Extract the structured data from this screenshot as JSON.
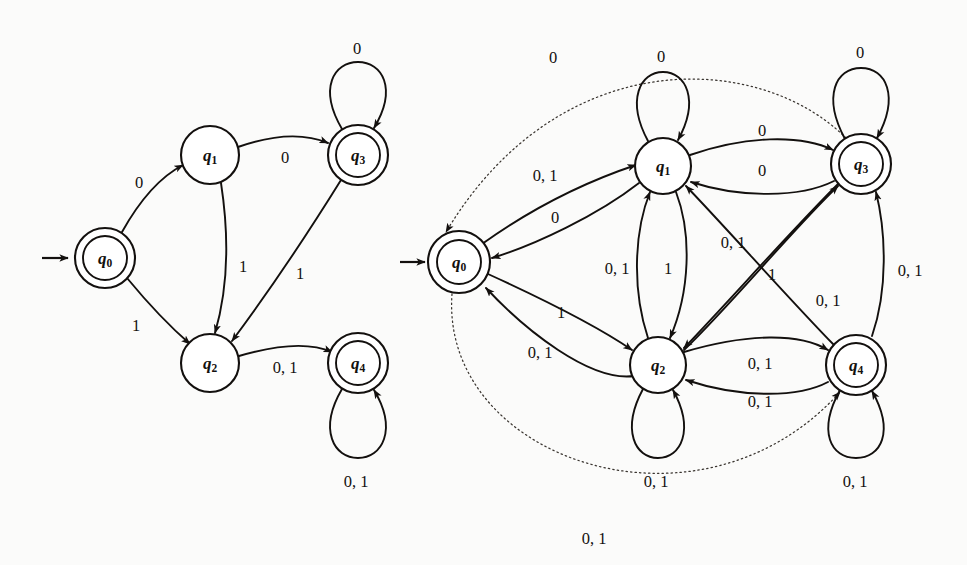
{
  "figure": {
    "background_color": "#fbfbfa",
    "ink_color": "#13100e",
    "dotted_color": "#3a3530"
  },
  "alphabet": [
    "0",
    "1"
  ],
  "diagrams": [
    {
      "id": "left",
      "name": "left-automaton",
      "start_state": "q0",
      "states": [
        {
          "id": "q0",
          "label": "q",
          "sub": "0",
          "accepting": true,
          "cx": 105,
          "cy": 258,
          "r": 30
        },
        {
          "id": "q1",
          "label": "q",
          "sub": "1",
          "accepting": false,
          "cx": 210,
          "cy": 155,
          "r": 29
        },
        {
          "id": "q2",
          "label": "q",
          "sub": "2",
          "accepting": false,
          "cx": 210,
          "cy": 363,
          "r": 29
        },
        {
          "id": "q3",
          "label": "q",
          "sub": "3",
          "accepting": true,
          "cx": 358,
          "cy": 155,
          "r": 30
        },
        {
          "id": "q4",
          "label": "q",
          "sub": "4",
          "accepting": true,
          "cx": 358,
          "cy": 363,
          "r": 30
        }
      ],
      "transitions": [
        {
          "from": "q0",
          "to": "q1",
          "label": "0",
          "label_x": 139,
          "label_y": 182
        },
        {
          "from": "q0",
          "to": "q2",
          "label": "1",
          "label_x": 136,
          "label_y": 325
        },
        {
          "from": "q1",
          "to": "q3",
          "label": "0",
          "label_x": 285,
          "label_y": 157
        },
        {
          "from": "q1",
          "to": "q2",
          "label": "1",
          "label_x": 243,
          "label_y": 266
        },
        {
          "from": "q3",
          "to": "q2",
          "label": "1",
          "label_x": 300,
          "label_y": 273
        },
        {
          "from": "q3",
          "to": "q3",
          "label": "0",
          "label_x": 357,
          "label_y": 48,
          "self_loop": true
        },
        {
          "from": "q2",
          "to": "q4",
          "label": "0, 1",
          "label_x": 285,
          "label_y": 367
        },
        {
          "from": "q4",
          "to": "q4",
          "label": "0, 1",
          "label_x": 356,
          "label_y": 481,
          "self_loop": true
        }
      ]
    },
    {
      "id": "right",
      "name": "right-automaton",
      "start_state": "q0",
      "states": [
        {
          "id": "q0",
          "label": "q",
          "sub": "0",
          "accepting": true,
          "cx": 459,
          "cy": 262,
          "r": 31
        },
        {
          "id": "q1",
          "label": "q",
          "sub": "1",
          "accepting": false,
          "cx": 663,
          "cy": 166,
          "r": 28
        },
        {
          "id": "q2",
          "label": "q",
          "sub": "2",
          "accepting": false,
          "cx": 658,
          "cy": 365,
          "r": 28
        },
        {
          "id": "q3",
          "label": "q",
          "sub": "3",
          "accepting": true,
          "cx": 861,
          "cy": 164,
          "r": 30
        },
        {
          "id": "q4",
          "label": "q",
          "sub": "4",
          "accepting": true,
          "cx": 856,
          "cy": 365,
          "r": 30
        }
      ],
      "transitions": [
        {
          "from": "q0",
          "to": "q1",
          "label": "0, 1",
          "label_x": 545,
          "label_y": 175
        },
        {
          "from": "q1",
          "to": "q0",
          "label": "0",
          "label_x": 555,
          "label_y": 217
        },
        {
          "from": "q0",
          "to": "q2",
          "label": "1",
          "label_x": 561,
          "label_y": 312
        },
        {
          "from": "q2",
          "to": "q0",
          "label": "0, 1",
          "label_x": 540,
          "label_y": 352
        },
        {
          "from": "q1",
          "to": "q1",
          "label": "0",
          "label_x": 661,
          "label_y": 56,
          "self_loop": true
        },
        {
          "from": "q2",
          "to": "q2",
          "label": "0, 1",
          "label_x": 656,
          "label_y": 481,
          "self_loop": true
        },
        {
          "from": "q3",
          "to": "q3",
          "label": "0",
          "label_x": 860,
          "label_y": 52,
          "self_loop": true
        },
        {
          "from": "q4",
          "to": "q4",
          "label": "0, 1",
          "label_x": 855,
          "label_y": 481,
          "self_loop": true
        },
        {
          "from": "q1",
          "to": "q3",
          "label": "0",
          "label_x": 762,
          "label_y": 130
        },
        {
          "from": "q3",
          "to": "q1",
          "label": "0",
          "label_x": 762,
          "label_y": 170
        },
        {
          "from": "q2",
          "to": "q1",
          "label": "0, 1",
          "label_x": 617,
          "label_y": 268
        },
        {
          "from": "q1",
          "to": "q2",
          "label": "1",
          "label_x": 668,
          "label_y": 268
        },
        {
          "from": "q3",
          "to": "q2",
          "label": "0, 1",
          "label_x": 733,
          "label_y": 242
        },
        {
          "from": "q2",
          "to": "q3",
          "label": "1",
          "label_x": 772,
          "label_y": 274
        },
        {
          "from": "q4",
          "to": "q1",
          "label": "0, 1",
          "label_x": 828,
          "label_y": 300
        },
        {
          "from": "q4",
          "to": "q3",
          "label": "0, 1",
          "label_x": 910,
          "label_y": 270
        },
        {
          "from": "q2",
          "to": "q4",
          "label": "0, 1",
          "label_x": 760,
          "label_y": 363
        },
        {
          "from": "q4",
          "to": "q2",
          "label": "0, 1",
          "label_x": 760,
          "label_y": 401
        },
        {
          "from": "q3",
          "to": "q0",
          "label": "0",
          "label_x": 553,
          "label_y": 57,
          "dotted": true
        },
        {
          "from": "q0",
          "to": "q4",
          "label": "0, 1",
          "label_x": 594,
          "label_y": 538,
          "dotted": true
        }
      ]
    }
  ]
}
